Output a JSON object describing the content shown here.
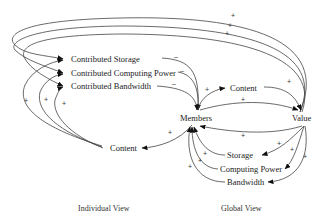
{
  "nodes": {
    "contributed_storage": "Contributed Storage",
    "contributed_computing_power": "Contributed Computing Power",
    "contributed_bandwidth": "Contributed Bandwidth",
    "content_individual": "Content",
    "members": "Members",
    "content_global": "Content",
    "value": "Value",
    "storage": "Storage",
    "computing_power": "Computing Power",
    "bandwidth": "Bandwidth"
  },
  "captions": {
    "individual": "Individual View",
    "global": "Global View"
  },
  "signs": {
    "plus": "+",
    "minus": "–"
  },
  "edges": [
    {
      "from": "Value",
      "to": "Contributed Storage",
      "polarity": "+"
    },
    {
      "from": "Value",
      "to": "Contributed Computing Power",
      "polarity": "+"
    },
    {
      "from": "Value",
      "to": "Contributed Bandwidth",
      "polarity": "+"
    },
    {
      "from": "Content (individual)",
      "to": "Contributed Storage",
      "polarity": "+"
    },
    {
      "from": "Content (individual)",
      "to": "Contributed Computing Power",
      "polarity": "+"
    },
    {
      "from": "Content (individual)",
      "to": "Contributed Bandwidth",
      "polarity": "+"
    },
    {
      "from": "Contributed Storage",
      "to": "Members",
      "polarity": "-"
    },
    {
      "from": "Contributed Computing Power",
      "to": "Members",
      "polarity": "-"
    },
    {
      "from": "Contributed Bandwidth",
      "to": "Members",
      "polarity": "-"
    },
    {
      "from": "Members",
      "to": "Content (individual)",
      "polarity": "+"
    },
    {
      "from": "Members",
      "to": "Content (global)",
      "polarity": "+"
    },
    {
      "from": "Content (global)",
      "to": "Value",
      "polarity": "+"
    },
    {
      "from": "Members",
      "to": "Value",
      "polarity": "+"
    },
    {
      "from": "Value",
      "to": "Members",
      "polarity": "+"
    },
    {
      "from": "Value",
      "to": "Storage",
      "polarity": "+"
    },
    {
      "from": "Value",
      "to": "Computing Power",
      "polarity": "+"
    },
    {
      "from": "Value",
      "to": "Bandwidth",
      "polarity": "+"
    },
    {
      "from": "Storage",
      "to": "Members",
      "polarity": "+"
    },
    {
      "from": "Computing Power",
      "to": "Members",
      "polarity": "+"
    },
    {
      "from": "Bandwidth",
      "to": "Members",
      "polarity": "+"
    }
  ]
}
